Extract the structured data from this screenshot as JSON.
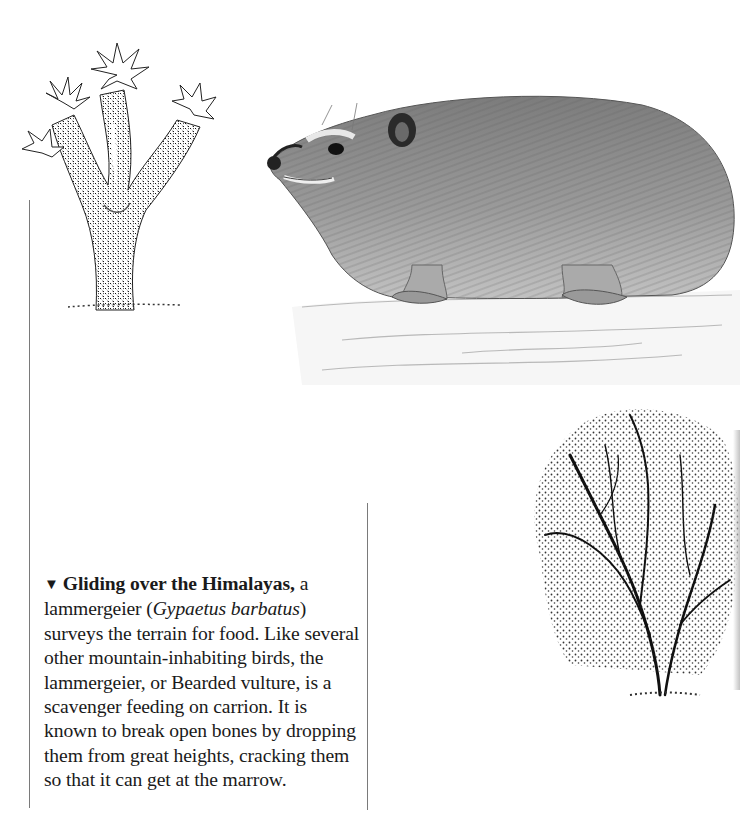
{
  "illustrations": {
    "cactus": {
      "label": "Branched flowering cactus (Joshua-tree-like), stipple ink drawing"
    },
    "hyrax": {
      "label": "Rock hyrax on a rock ledge, pencil drawing"
    },
    "shrub": {
      "label": "Bushy shrub/tree, stipple ink drawing"
    }
  },
  "caption": {
    "marker": "▼",
    "lead": "Gliding over the Himalayas,",
    "text_1": " a lammergeier (",
    "species": "Gypaetus barbatus",
    "text_2": ") surveys the terrain for food. Like several other mountain-inhabiting birds, the lammergeier, or Bearded vulture, is a scavenger feeding on carrion. It is known to break open bones by dropping them from great heights, cracking them so that it can get at the marrow."
  },
  "colors": {
    "rule": "#7a7a7a",
    "text": "#1a1a1a",
    "background": "#ffffff"
  }
}
